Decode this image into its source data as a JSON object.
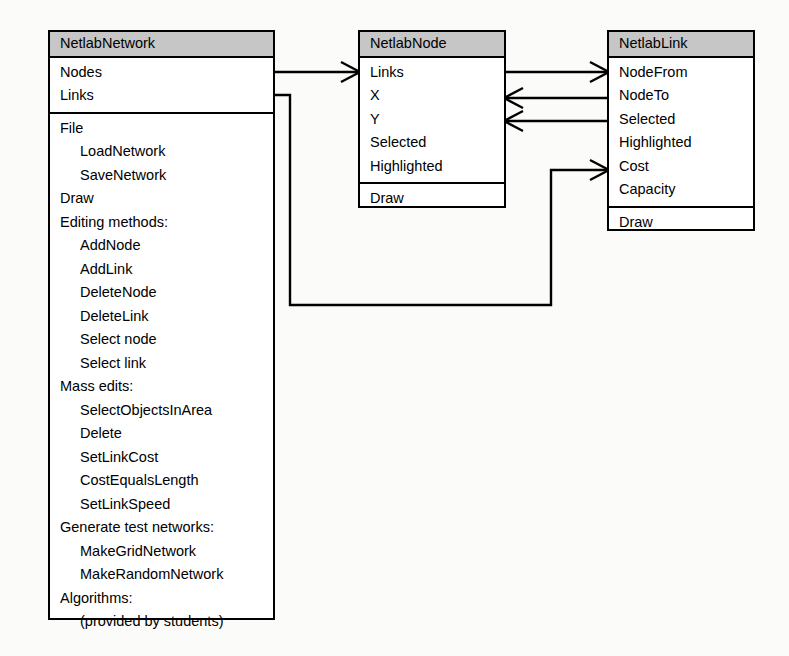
{
  "diagram": {
    "background_color": "#fbfbfa",
    "line_color": "#000000",
    "title_fill_color": "#c6c6c6",
    "classes": [
      {
        "id": "netlab-network",
        "name": "NetlabNetwork",
        "attributes": [
          {
            "label": "Nodes",
            "indent": false
          },
          {
            "label": "Links",
            "indent": false
          }
        ],
        "methods": [
          {
            "label": "File",
            "indent": false
          },
          {
            "label": "LoadNetwork",
            "indent": true
          },
          {
            "label": "SaveNetwork",
            "indent": true
          },
          {
            "label": "Draw",
            "indent": false
          },
          {
            "label": "Editing methods:",
            "indent": false
          },
          {
            "label": "AddNode",
            "indent": true
          },
          {
            "label": "AddLink",
            "indent": true
          },
          {
            "label": "DeleteNode",
            "indent": true
          },
          {
            "label": "DeleteLink",
            "indent": true
          },
          {
            "label": "Select node",
            "indent": true
          },
          {
            "label": "Select link",
            "indent": true
          },
          {
            "label": "Mass edits:",
            "indent": false
          },
          {
            "label": "SelectObjectsInArea",
            "indent": true
          },
          {
            "label": "Delete",
            "indent": true
          },
          {
            "label": "SetLinkCost",
            "indent": true
          },
          {
            "label": "CostEqualsLength",
            "indent": true
          },
          {
            "label": "SetLinkSpeed",
            "indent": true
          },
          {
            "label": "Generate test networks:",
            "indent": false
          },
          {
            "label": "MakeGridNetwork",
            "indent": true
          },
          {
            "label": "MakeRandomNetwork",
            "indent": true
          },
          {
            "label": "Algorithms:",
            "indent": false
          },
          {
            "label": "(provided by students)",
            "indent": true
          }
        ]
      },
      {
        "id": "netlab-node",
        "name": "NetlabNode",
        "attributes": [
          {
            "label": "Links",
            "indent": false
          },
          {
            "label": "X",
            "indent": false
          },
          {
            "label": "Y",
            "indent": false
          },
          {
            "label": "Selected",
            "indent": false
          },
          {
            "label": "Highlighted",
            "indent": false
          }
        ],
        "methods": [
          {
            "label": "Draw",
            "indent": false
          }
        ]
      },
      {
        "id": "netlab-link",
        "name": "NetlabLink",
        "attributes": [
          {
            "label": "NodeFrom",
            "indent": false
          },
          {
            "label": "NodeTo",
            "indent": false
          },
          {
            "label": "Selected",
            "indent": false
          },
          {
            "label": "Highlighted",
            "indent": false
          },
          {
            "label": "Cost",
            "indent": false
          },
          {
            "label": "Capacity",
            "indent": false
          }
        ],
        "methods": [
          {
            "label": "Draw",
            "indent": false
          }
        ]
      }
    ],
    "connectors": [
      {
        "id": "network-nodes-to-node",
        "from": "NetlabNetwork.Nodes",
        "to": "NetlabNode",
        "direction": "right"
      },
      {
        "id": "network-links-to-link",
        "from": "NetlabNetwork.Links",
        "to": "NetlabLink",
        "direction": "right"
      },
      {
        "id": "node-links-to-link",
        "from": "NetlabNode.Links",
        "to": "NetlabLink",
        "direction": "right"
      },
      {
        "id": "link-nodefrom-to-node",
        "from": "NetlabLink.NodeFrom",
        "to": "NetlabNode",
        "direction": "left"
      },
      {
        "id": "link-nodeto-to-node",
        "from": "NetlabLink.NodeTo",
        "to": "NetlabNode",
        "direction": "left"
      }
    ]
  }
}
